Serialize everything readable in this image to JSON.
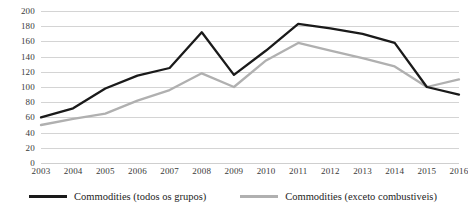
{
  "chart_data": {
    "type": "line",
    "title": "",
    "xlabel": "",
    "ylabel": "",
    "ylim": [
      0,
      200
    ],
    "ytick_step": 20,
    "grid": true,
    "legend_position": "bottom-center",
    "categories": [
      "2003",
      "2004",
      "2005",
      "2006",
      "2007",
      "2008",
      "2009",
      "2010",
      "2011",
      "2012",
      "2013",
      "2014",
      "2015",
      "2016"
    ],
    "yticks": [
      "0",
      "20",
      "40",
      "60",
      "80",
      "100",
      "120",
      "140",
      "160",
      "180",
      "200"
    ],
    "series": [
      {
        "name": "Commodities (todos os grupos)",
        "color": "#1a1a1a",
        "values": [
          60,
          72,
          98,
          115,
          125,
          172,
          116,
          148,
          183,
          177,
          170,
          158,
          100,
          90
        ]
      },
      {
        "name": "Commodities (exceto combustiveis)",
        "color": "#b0b0b0",
        "values": [
          50,
          58,
          65,
          82,
          96,
          118,
          100,
          135,
          158,
          148,
          138,
          127,
          100,
          110
        ]
      }
    ]
  },
  "legend": {
    "items": [
      {
        "label": "Commodities (todos os grupos)",
        "color": "#1a1a1a"
      },
      {
        "label": "Commodities (exceto combustiveis)",
        "color": "#b0b0b0"
      }
    ]
  },
  "colors": {
    "gridline": "#d4d4d4",
    "axis_text": "#3a3a3a",
    "background": "#ffffff"
  }
}
